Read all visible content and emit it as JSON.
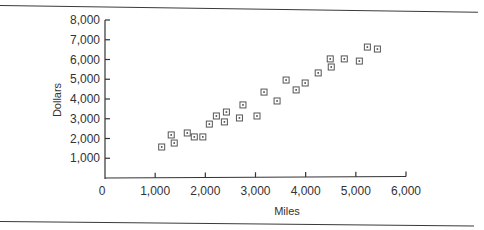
{
  "chart_data": {
    "type": "scatter",
    "title": "",
    "xlabel": "Miles",
    "ylabel": "Dollars",
    "xlim": [
      0,
      6000
    ],
    "ylim": [
      0,
      8000
    ],
    "grid": false,
    "legend": null,
    "x_ticks": [
      0,
      1000,
      2000,
      3000,
      4000,
      5000,
      6000
    ],
    "x_tick_labels": [
      "0",
      "1,000",
      "2,000",
      "3,000",
      "4,000",
      "5,000",
      "6,000"
    ],
    "y_ticks": [
      1000,
      2000,
      3000,
      4000,
      5000,
      6000,
      7000,
      8000
    ],
    "y_tick_labels": [
      "1,000",
      "2,000",
      "3,000",
      "4,000",
      "5,000",
      "6,000",
      "7,000",
      "8,000"
    ],
    "marker": "square-with-dot",
    "series": [
      {
        "name": "Dollars vs Miles",
        "x": [
          1130,
          1320,
          1380,
          1640,
          1780,
          1950,
          2080,
          2220,
          2380,
          2420,
          2680,
          2750,
          3030,
          3170,
          3430,
          3610,
          3810,
          3990,
          4250,
          4490,
          4510,
          4770,
          5070,
          5230,
          5430
        ],
        "y": [
          1570,
          2180,
          1770,
          2280,
          2080,
          2080,
          2730,
          3140,
          2840,
          3340,
          3040,
          3700,
          3140,
          4350,
          3900,
          4960,
          4460,
          4810,
          5320,
          6030,
          5620,
          6030,
          5920,
          6630,
          6530
        ]
      }
    ]
  },
  "labels": {
    "xlabel": "Miles",
    "ylabel": "Dollars",
    "origin": "0"
  }
}
